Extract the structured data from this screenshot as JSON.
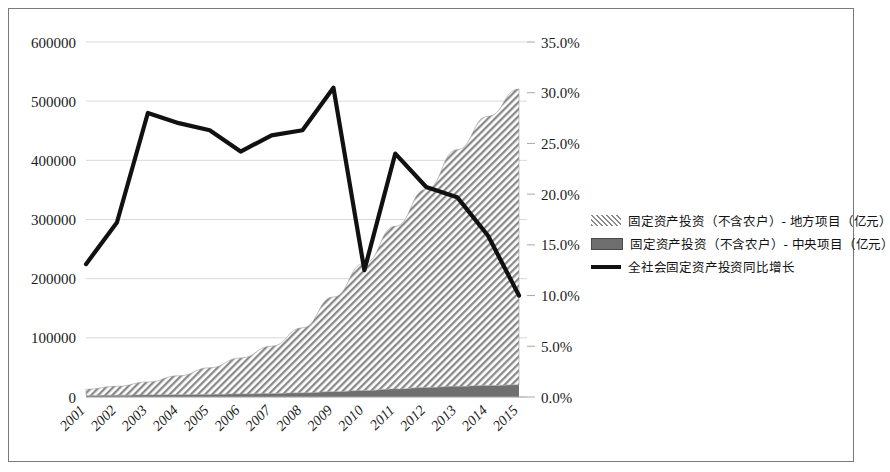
{
  "chart_data": {
    "type": "area",
    "title": "",
    "subtitle": "",
    "xlabel": "",
    "ylabel": "",
    "grid": true,
    "legend_position": "right",
    "categories": [
      "2001",
      "2002",
      "2003",
      "2004",
      "2005",
      "2006",
      "2007",
      "2008",
      "2009",
      "2010",
      "2011",
      "2012",
      "2013",
      "2014",
      "2015"
    ],
    "x_tick_labels": [
      "2001",
      "2002",
      "2003",
      "2004",
      "2005",
      "2006",
      "2007",
      "2008",
      "2009",
      "2010",
      "2011",
      "2012",
      "2013",
      "2014",
      "2015"
    ],
    "left_axis": {
      "label": "",
      "ylim": [
        0,
        600000
      ],
      "tick_step": 100000,
      "tick_labels": [
        "0",
        "100000",
        "200000",
        "300000",
        "400000",
        "500000",
        "600000"
      ],
      "tick_values": [
        0,
        100000,
        200000,
        300000,
        400000,
        500000,
        600000
      ]
    },
    "right_axis": {
      "label": "",
      "ylim": [
        0,
        35
      ],
      "tick_step": 5,
      "tick_labels": [
        "0.0%",
        "5.0%",
        "10.0%",
        "15.0%",
        "20.0%",
        "25.0%",
        "30.0%",
        "35.0%"
      ],
      "tick_values": [
        0,
        5,
        10,
        15,
        20,
        25,
        30,
        35
      ]
    },
    "series": [
      {
        "name": "固定资产投资（不含农户）- 地方项目（亿元）",
        "type": "area",
        "stacked": true,
        "axis": "left",
        "fill": "diagonal-hatch",
        "color": "#8c8c8c",
        "values": [
          10500,
          15000,
          22000,
          32000,
          45000,
          61000,
          80000,
          110000,
          160000,
          215000,
          275000,
          335000,
          400000,
          455000,
          500000
        ]
      },
      {
        "name": "固定资产投资（不含农户）- 中央项目（亿元）",
        "type": "area",
        "stacked": true,
        "axis": "left",
        "fill": "solid",
        "color": "#707070",
        "values": [
          2600,
          3000,
          3400,
          3900,
          4400,
          5000,
          5800,
          7000,
          9000,
          11000,
          13500,
          16000,
          18000,
          19500,
          20500
        ]
      },
      {
        "name": "全社会固定资产投资同比增长",
        "type": "line",
        "axis": "right",
        "color": "#111111",
        "values": [
          13.1,
          17.2,
          28.0,
          27.0,
          26.3,
          24.2,
          25.8,
          26.3,
          30.5,
          12.5,
          24.0,
          20.7,
          19.7,
          15.9,
          10.0
        ]
      }
    ]
  },
  "legend": {
    "items": [
      {
        "label": "固定资产投资（不含农户）- 地方项目（亿元）",
        "marker": "hatch-swatch"
      },
      {
        "label": "固定资产投资（不含农户）- 中央项目（亿元）",
        "marker": "solid-swatch"
      },
      {
        "label": "全社会固定资产投资同比增长",
        "marker": "line-swatch"
      }
    ]
  },
  "colors": {
    "hatch": "#8c8c8c",
    "central": "#6f6f6f",
    "line": "#111111",
    "grid": "#d9d9d9",
    "border": "#7a7a7a",
    "axis": "#a8a8a8"
  }
}
